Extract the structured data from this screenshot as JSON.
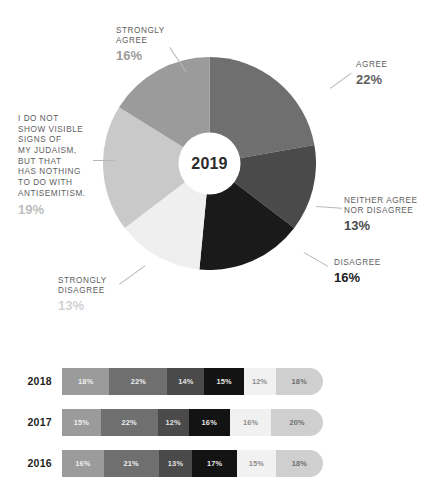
{
  "chart_data": [
    {
      "type": "pie",
      "title": "2019",
      "center_label": "2019",
      "legend_position": "callout-labels",
      "unit": "%",
      "categories": [
        "AGREE",
        "NEITHER AGREE NOR DISAGREE",
        "DISAGREE",
        "STRONGLY DISAGREE",
        "I DO NOT SHOW VISIBLE SIGNS OF MY JUDAISM, BUT THAT HAS NOTHING TO DO WITH ANTISEMITISM.",
        "STRONGLY AGREE"
      ],
      "values": [
        22,
        13,
        16,
        13,
        19,
        16
      ],
      "colors": [
        "#6f6f6f",
        "#4a4a4a",
        "#1a1a1a",
        "#efefef",
        "#c9c9c9",
        "#9b9b9b"
      ],
      "slices": [
        {
          "name": "AGREE",
          "label_lines": [
            "AGREE"
          ],
          "value": 22,
          "value_label": "22%",
          "color": "#6f6f6f",
          "pct_color": "#5f5f5f"
        },
        {
          "name": "NEITHER AGREE NOR DISAGREE",
          "label_lines": [
            "NEITHER AGREE",
            "NOR DISAGREE"
          ],
          "value": 13,
          "value_label": "13%",
          "color": "#4a4a4a",
          "pct_color": "#4a4a4a"
        },
        {
          "name": "DISAGREE",
          "label_lines": [
            "DISAGREE"
          ],
          "value": 16,
          "value_label": "16%",
          "color": "#1a1a1a",
          "pct_color": "#222222"
        },
        {
          "name": "STRONGLY DISAGREE",
          "label_lines": [
            "STRONGLY",
            "DISAGREE"
          ],
          "value": 13,
          "value_label": "13%",
          "color": "#efefef",
          "pct_color": "#d2d2d2"
        },
        {
          "name": "I DO NOT SHOW VISIBLE SIGNS OF MY JUDAISM, BUT THAT HAS NOTHING TO DO WITH ANTISEMITISM.",
          "label_lines": [
            "I DO NOT",
            "SHOW VISIBLE",
            "SIGNS OF",
            "MY JUDAISM,",
            "BUT THAT",
            "HAS NOTHING",
            "TO DO WITH",
            "ANTISEMITISM."
          ],
          "value": 19,
          "value_label": "19%",
          "color": "#c9c9c9",
          "pct_color": "#bdbdbd"
        },
        {
          "name": "STRONGLY AGREE",
          "label_lines": [
            "STRONGLY",
            "AGREE"
          ],
          "value": 16,
          "value_label": "16%",
          "color": "#9b9b9b",
          "pct_color": "#9b9b9b"
        }
      ]
    },
    {
      "type": "bar",
      "subtype": "stacked-horizontal",
      "categories": [
        "2018",
        "2017",
        "2016"
      ],
      "series_names": [
        "AGREE",
        "NEITHER AGREE NOR DISAGREE",
        "DISAGREE",
        "STRONGLY DISAGREE",
        "I DO NOT SHOW VISIBLE SIGNS OF MY JUDAISM, BUT THAT HAS NOTHING TO DO WITH ANTISEMITISM.",
        "STRONGLY AGREE"
      ],
      "rows": [
        {
          "year": "2018",
          "segments": [
            {
              "value": 18,
              "label": "18%",
              "color": "#9b9b9b",
              "text_color": "#efefef"
            },
            {
              "value": 22,
              "label": "22%",
              "color": "#6f6f6f",
              "text_color": "#efefef"
            },
            {
              "value": 14,
              "label": "14%",
              "color": "#4a4a4a",
              "text_color": "#e2e2e2"
            },
            {
              "value": 15,
              "label": "15%",
              "color": "#131313",
              "text_color": "#e8e8e8"
            },
            {
              "value": 12,
              "label": "12%",
              "color": "#f1f1f1",
              "text_color": "#8c8c8c"
            },
            {
              "value": 18,
              "label": "18%",
              "color": "#cfcfcf",
              "text_color": "#6e6e6e"
            }
          ]
        },
        {
          "year": "2017",
          "segments": [
            {
              "value": 15,
              "label": "15%",
              "color": "#9b9b9b",
              "text_color": "#efefef"
            },
            {
              "value": 22,
              "label": "22%",
              "color": "#6f6f6f",
              "text_color": "#efefef"
            },
            {
              "value": 12,
              "label": "12%",
              "color": "#4a4a4a",
              "text_color": "#e2e2e2"
            },
            {
              "value": 16,
              "label": "16%",
              "color": "#131313",
              "text_color": "#e8e8e8"
            },
            {
              "value": 16,
              "label": "16%",
              "color": "#f1f1f1",
              "text_color": "#8c8c8c"
            },
            {
              "value": 20,
              "label": "20%",
              "color": "#cfcfcf",
              "text_color": "#6e6e6e"
            }
          ]
        },
        {
          "year": "2016",
          "segments": [
            {
              "value": 16,
              "label": "16%",
              "color": "#9b9b9b",
              "text_color": "#efefef"
            },
            {
              "value": 21,
              "label": "21%",
              "color": "#6f6f6f",
              "text_color": "#efefef"
            },
            {
              "value": 13,
              "label": "13%",
              "color": "#4a4a4a",
              "text_color": "#e2e2e2"
            },
            {
              "value": 17,
              "label": "17%",
              "color": "#131313",
              "text_color": "#e8e8e8"
            },
            {
              "value": 15,
              "label": "15%",
              "color": "#f1f1f1",
              "text_color": "#8c8c8c"
            },
            {
              "value": 18,
              "label": "18%",
              "color": "#cfcfcf",
              "text_color": "#6e6e6e"
            }
          ]
        }
      ]
    }
  ],
  "pie": {
    "center_label": "2019"
  },
  "bars": {
    "rows": [
      {
        "year": "2018"
      },
      {
        "year": "2017"
      },
      {
        "year": "2016"
      }
    ]
  }
}
